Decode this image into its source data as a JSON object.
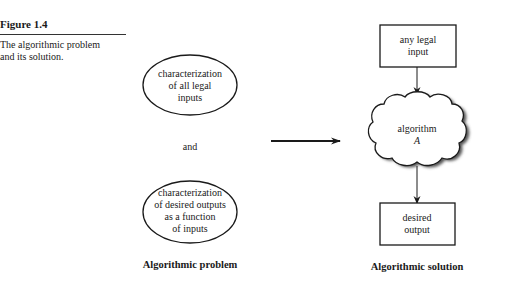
{
  "caption": {
    "figure_number": "Figure 1.4",
    "text_line1": "The algorithmic problem",
    "text_line2": "and its solution."
  },
  "problem": {
    "inputs_ellipse": [
      "characterization",
      "of all legal",
      "inputs"
    ],
    "connector": "and",
    "outputs_ellipse": [
      "characterization",
      "of desired outputs",
      "as a function",
      "of inputs"
    ],
    "title": "Algorithmic problem"
  },
  "solution": {
    "input_box": [
      "any legal",
      "input"
    ],
    "algorithm_cloud": [
      "algorithm",
      "A"
    ],
    "output_box": [
      "desired",
      "output"
    ],
    "title": "Algorithmic solution"
  },
  "colors": {
    "ink": "#1a1a1a",
    "shadow": "#555555",
    "background": "#ffffff"
  }
}
